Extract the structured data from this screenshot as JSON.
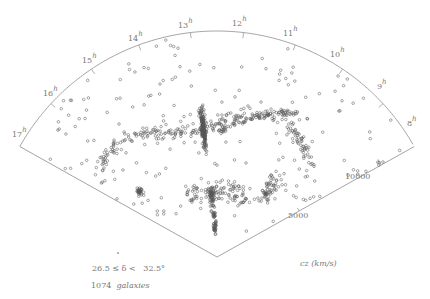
{
  "chart_data": {
    "type": "scatter",
    "subtype": "redshift-wedge (polar cone diagram)",
    "title": "",
    "angular_axis": {
      "label": "right ascension",
      "ticks": [
        "8h",
        "9h",
        "10h",
        "11h",
        "12h",
        "13h",
        "14h",
        "15h",
        "16h",
        "17h"
      ],
      "range_hours": [
        8,
        17
      ]
    },
    "radial_axis": {
      "label": "cz (km/s)",
      "ticks": [
        5000,
        10000
      ],
      "range": [
        0,
        12000
      ]
    },
    "declination_range": "26.5 ≤ δ < 32.5°",
    "galaxy_count": 1074,
    "series": [
      {
        "name": "galaxies",
        "n_points": 1074,
        "marker": "open circle"
      }
    ],
    "structures": [
      {
        "name": "Coma cluster finger",
        "ra_h": 12.9,
        "cz": 7000
      },
      {
        "name": "Great Wall filament",
        "ra_h_range": [
          9,
          16.5
        ],
        "cz": 7500
      }
    ],
    "grid": false,
    "legend": "none"
  },
  "labels": {
    "hours": [
      {
        "text": "8",
        "sup": "h"
      },
      {
        "text": "9",
        "sup": "h"
      },
      {
        "text": "10",
        "sup": "h"
      },
      {
        "text": "11",
        "sup": "h"
      },
      {
        "text": "12",
        "sup": "h"
      },
      {
        "text": "13",
        "sup": "h"
      },
      {
        "text": "14",
        "sup": "h"
      },
      {
        "text": "15",
        "sup": "h"
      },
      {
        "text": "16",
        "sup": "h"
      },
      {
        "text": "17",
        "sup": "h"
      }
    ],
    "cz_5000": "5000",
    "cz_10000": "10000",
    "cz_axis": "cz (km/s)",
    "declination": "26.5 ≤ δ <   32.5°",
    "count_number": "1074",
    "count_word": "galaxies"
  },
  "colors": {
    "outline": "#9a9a9a",
    "points": "#555555",
    "text": "#777777"
  }
}
